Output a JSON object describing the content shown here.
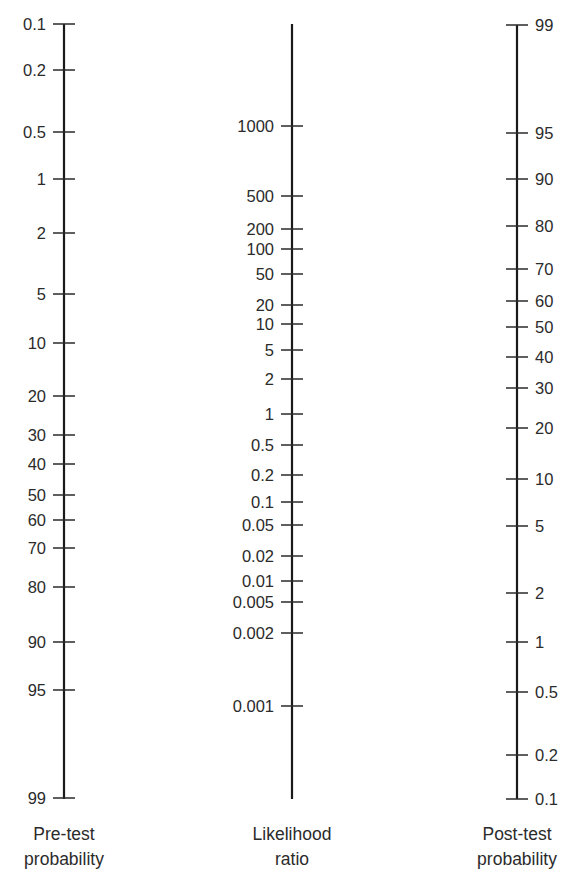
{
  "chart_data": {
    "type": "nomogram",
    "axes": [
      {
        "id": "pretest",
        "title_lines": [
          "Pre-test",
          "probability"
        ],
        "label_side": "left",
        "x": 64,
        "y_top": 24,
        "y_bottom": 799,
        "cap_top": true,
        "cap_bottom": true,
        "ticks": [
          {
            "label": "0.1",
            "y": 24
          },
          {
            "label": "0.2",
            "y": 70
          },
          {
            "label": "0.5",
            "y": 132
          },
          {
            "label": "1",
            "y": 179
          },
          {
            "label": "2",
            "y": 233
          },
          {
            "label": "5",
            "y": 294
          },
          {
            "label": "10",
            "y": 343
          },
          {
            "label": "20",
            "y": 396
          },
          {
            "label": "30",
            "y": 435
          },
          {
            "label": "40",
            "y": 464
          },
          {
            "label": "50",
            "y": 495
          },
          {
            "label": "60",
            "y": 520
          },
          {
            "label": "70",
            "y": 548
          },
          {
            "label": "80",
            "y": 587
          },
          {
            "label": "90",
            "y": 642
          },
          {
            "label": "95",
            "y": 690
          },
          {
            "label": "99",
            "y": 798
          }
        ]
      },
      {
        "id": "likelihood",
        "title_lines": [
          "Likelihood",
          "ratio"
        ],
        "label_side": "left",
        "x": 292,
        "y_top": 24,
        "y_bottom": 799,
        "cap_top": false,
        "cap_bottom": false,
        "ticks": [
          {
            "label": "1000",
            "y": 126
          },
          {
            "label": "500",
            "y": 196
          },
          {
            "label": "200",
            "y": 229
          },
          {
            "label": "100",
            "y": 249
          },
          {
            "label": "50",
            "y": 274
          },
          {
            "label": "20",
            "y": 305
          },
          {
            "label": "10",
            "y": 324
          },
          {
            "label": "5",
            "y": 350
          },
          {
            "label": "2",
            "y": 379
          },
          {
            "label": "1",
            "y": 414
          },
          {
            "label": "0.5",
            "y": 445
          },
          {
            "label": "0.2",
            "y": 475
          },
          {
            "label": "0.1",
            "y": 502
          },
          {
            "label": "0.05",
            "y": 525
          },
          {
            "label": "0.02",
            "y": 556
          },
          {
            "label": "0.01",
            "y": 581
          },
          {
            "label": "0.005",
            "y": 602
          },
          {
            "label": "0.002",
            "y": 633
          },
          {
            "label": "0.001",
            "y": 706
          }
        ]
      },
      {
        "id": "posttest",
        "title_lines": [
          "Post-test",
          "probability"
        ],
        "label_side": "right",
        "x": 517,
        "y_top": 25,
        "y_bottom": 799,
        "cap_top": true,
        "cap_bottom": true,
        "ticks": [
          {
            "label": "99",
            "y": 25
          },
          {
            "label": "95",
            "y": 133
          },
          {
            "label": "90",
            "y": 179
          },
          {
            "label": "80",
            "y": 226
          },
          {
            "label": "70",
            "y": 269
          },
          {
            "label": "60",
            "y": 301
          },
          {
            "label": "50",
            "y": 327
          },
          {
            "label": "40",
            "y": 357
          },
          {
            "label": "30",
            "y": 388
          },
          {
            "label": "20",
            "y": 428
          },
          {
            "label": "10",
            "y": 479
          },
          {
            "label": "5",
            "y": 526
          },
          {
            "label": "2",
            "y": 593
          },
          {
            "label": "1",
            "y": 642
          },
          {
            "label": "0.5",
            "y": 692
          },
          {
            "label": "0.2",
            "y": 755
          },
          {
            "label": "0.1",
            "y": 799
          }
        ]
      }
    ],
    "xlabel": "",
    "ylabel": "",
    "grid": false,
    "legend": null
  },
  "colors": {
    "line": "#1a1a1a",
    "text": "#2b2b2b",
    "background": "#ffffff"
  }
}
